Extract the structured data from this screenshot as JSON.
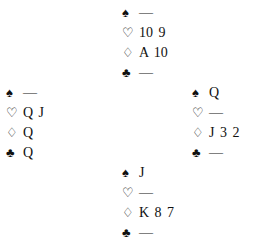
{
  "hands": {
    "north": {
      "spades": "—",
      "hearts": "10 9",
      "diamonds": "A 10",
      "clubs": "—"
    },
    "west": {
      "spades": "—",
      "hearts": "Q J",
      "diamonds": "Q",
      "clubs": "Q"
    },
    "east": {
      "spades": "Q",
      "hearts": "—",
      "diamonds": "J 3 2",
      "clubs": "—"
    },
    "south": {
      "spades": "J",
      "hearts": "—",
      "diamonds": "K 8 7",
      "clubs": "—"
    }
  },
  "suits": {
    "spades": "♠",
    "hearts": "♡",
    "diamonds": "♢",
    "clubs": "♣"
  }
}
